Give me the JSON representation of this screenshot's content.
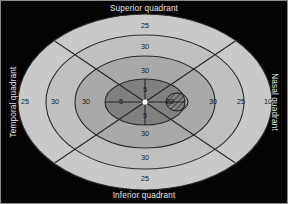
{
  "figure": {
    "title_present": false,
    "background_color": "#040404",
    "border_color": "#8c8c8c"
  },
  "labels": {
    "superior": "Superior quadrant",
    "inferior": "Inferior quadrant",
    "temporal": "Temporal quadrant",
    "nasal": "Nasal quadrant"
  },
  "chart_data": {
    "type": "scatter",
    "subtitle": "",
    "xlabel": "",
    "ylabel": "",
    "grid": false,
    "legend_position": "none",
    "annotations": [
      "Superior quadrant",
      "Inferior quadrant",
      "Temporal quadrant",
      "Nasal quadrant"
    ],
    "rings": [
      {
        "index": 1,
        "name": "outer-isopter",
        "color": "#c9c9c9",
        "rx": 127,
        "ry": 88
      },
      {
        "index": 2,
        "name": "second-isopter",
        "color": "#c0c0c0",
        "rx": 99,
        "ry": 67
      },
      {
        "index": 3,
        "name": "third-isopter",
        "color": "#a9a9a9",
        "rx": 70,
        "ry": 46
      },
      {
        "index": 4,
        "name": "inner-isopter",
        "color": "#808080",
        "rx": 40,
        "ry": 23
      }
    ],
    "meridian_values": {
      "superior": [
        25,
        30,
        30,
        5
      ],
      "inferior": [
        5,
        30,
        30,
        25
      ],
      "temporal": [
        25,
        30,
        30,
        5
      ],
      "nasal": [
        20,
        30,
        25,
        10
      ]
    },
    "points": [
      {
        "label": "25",
        "meridian": "superior",
        "ring": 1,
        "x": 144,
        "y": 25
      },
      {
        "label": "30",
        "meridian": "superior",
        "ring": 2,
        "x": 144,
        "y": 46
      },
      {
        "label": "30",
        "meridian": "superior",
        "ring": 3,
        "x": 144,
        "y": 70
      },
      {
        "label": "5",
        "meridian": "superior",
        "ring": 4,
        "x": 144,
        "y": 89
      },
      {
        "label": "5",
        "meridian": "inferior",
        "ring": 4,
        "x": 144,
        "y": 115
      },
      {
        "label": "30",
        "meridian": "inferior",
        "ring": 3,
        "x": 144,
        "y": 133
      },
      {
        "label": "30",
        "meridian": "inferior",
        "ring": 2,
        "x": 144,
        "y": 157
      },
      {
        "label": "25",
        "meridian": "inferior",
        "ring": 1,
        "x": 144,
        "y": 178
      },
      {
        "label": "25",
        "meridian": "temporal",
        "ring": 1,
        "x": 24,
        "y": 101
      },
      {
        "label": "30",
        "meridian": "temporal",
        "ring": 2,
        "x": 54,
        "y": 101
      },
      {
        "label": "30",
        "meridian": "temporal",
        "ring": 3,
        "x": 85,
        "y": 101
      },
      {
        "label": "5",
        "meridian": "temporal",
        "ring": 4,
        "x": 120,
        "y": 101
      },
      {
        "label": "20",
        "meridian": "nasal",
        "ring": 4,
        "x": 169,
        "y": 101
      },
      {
        "label": "30",
        "meridian": "nasal",
        "ring": 3,
        "x": 212,
        "y": 101
      },
      {
        "label": "25",
        "meridian": "nasal",
        "ring": 2,
        "x": 240,
        "y": 101
      },
      {
        "label": "10",
        "meridian": "nasal",
        "ring": 1,
        "x": 267,
        "y": 101
      }
    ],
    "fixation_point": {
      "x": 144,
      "y": 101,
      "color": "#ffffff"
    },
    "blind_spot": {
      "x": 176,
      "y": 101,
      "rx": 11,
      "ry": 9,
      "hatched": true
    }
  }
}
